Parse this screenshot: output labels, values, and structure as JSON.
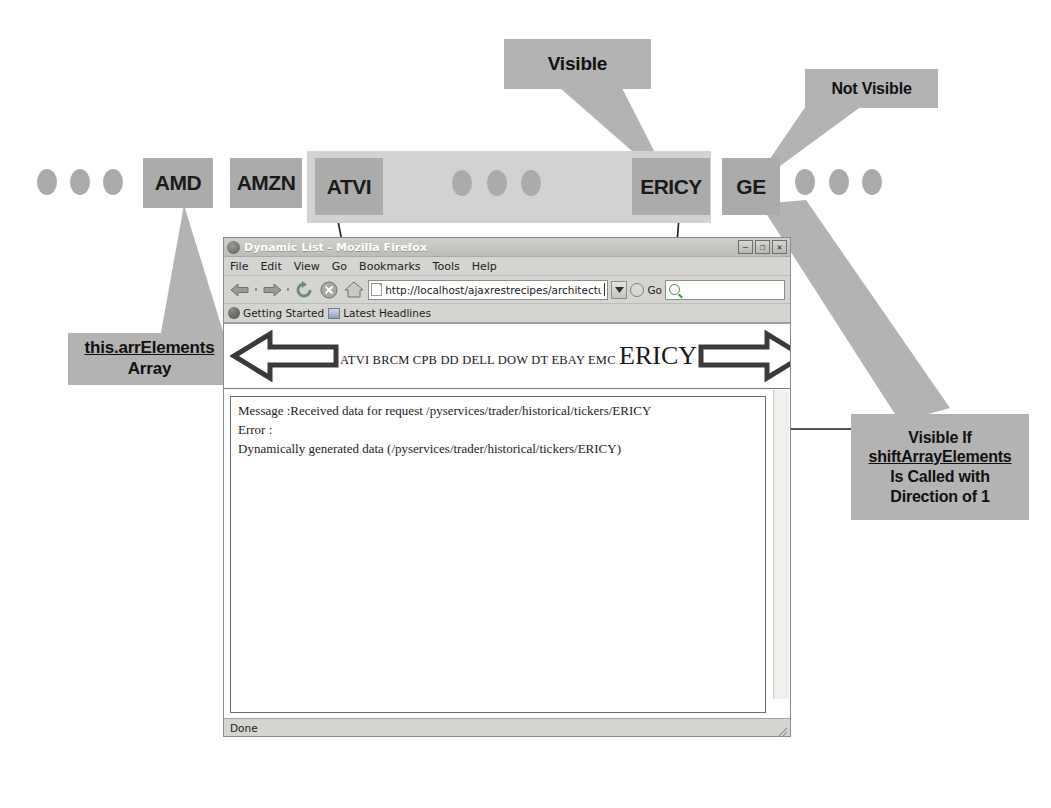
{
  "diagram": {
    "callouts": {
      "visible": "Visible",
      "not_visible": "Not Visible",
      "array_label_line1": "this.arrElements",
      "array_label_line2": "Array",
      "right_line1": "Visible If",
      "right_line2": "shiftArrayElements",
      "right_line3": "Is Called with",
      "right_line4": "Direction of 1"
    },
    "strip": {
      "tickers": [
        "AMD",
        "AMZN",
        "ATVI",
        "ERICY",
        "GE"
      ],
      "ellipsis_count_left": 3,
      "ellipsis_count_middle": 3,
      "ellipsis_count_right": 3
    }
  },
  "browser": {
    "window_title": "Dynamic List - Mozilla Firefox",
    "window_buttons": {
      "minimize": "–",
      "maximize": "❐",
      "close": "✕"
    },
    "menu": [
      "File",
      "Edit",
      "View",
      "Go",
      "Bookmarks",
      "Tools",
      "Help"
    ],
    "toolbar": {
      "back": "back-arrow",
      "forward": "forward-arrow",
      "reload": "reload-icon",
      "stop": "stop-icon",
      "home": "home-icon",
      "go_label": "Go",
      "search_placeholder": ""
    },
    "url": "http://localhost/ajaxrestrecipes/architecture/dynamiclist.html",
    "bookmarks": [
      {
        "label": "Getting Started",
        "icon": "globe-icon"
      },
      {
        "label": "Latest Headlines",
        "icon": "feed-icon"
      }
    ],
    "page": {
      "left_arrow": "shift-left-arrow",
      "right_arrow": "shift-right-arrow",
      "ticker_list_small": "ATVI BRCM CPB DD DELL DOW DT EBAY EMC",
      "ticker_list_highlighted": "ERICY",
      "log_lines": [
        "Message :Received data for request /pyservices/trader/historical/tickers/ERICY",
        "Error :",
        "Dynamically generated data (/pyservices/trader/historical/tickers/ERICY)"
      ]
    },
    "status": "Done"
  },
  "colors": {
    "callout_gray": "#b3b3b3",
    "ticker_gray": "#ababab",
    "strip_gray": "#d2d2d2",
    "chrome_gray": "#d4d4d0"
  }
}
